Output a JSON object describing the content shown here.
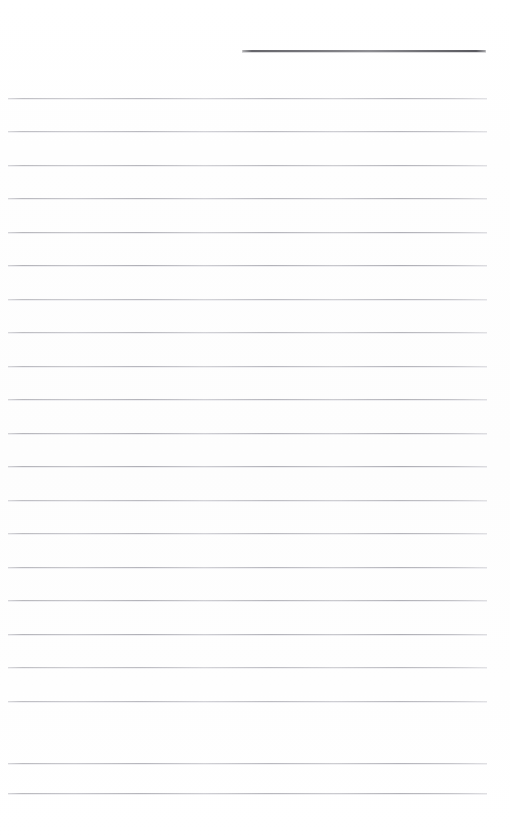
{
  "document": {
    "type": "lined-note-paper",
    "title": "",
    "page_width": 510,
    "page_height": 838,
    "background_color": "#ffffff",
    "written_content": "",
    "has_text": false
  },
  "header_rule": {
    "name": "header-rule",
    "description": "dark horizontal rule in upper right",
    "x": 242,
    "y": 50,
    "width": 244,
    "thickness": 2,
    "color": "#5a5a60"
  },
  "ruled_lines": {
    "count": 21,
    "color": "#b0b0b6",
    "thickness": 1,
    "left_x": 8,
    "right_x": 487,
    "line_width": 479,
    "first_y": 98,
    "spacing": 33.5,
    "positions": [
      98,
      131,
      165,
      198,
      232,
      265,
      299,
      332,
      366,
      399,
      433,
      466,
      500,
      533,
      567,
      600,
      634,
      667,
      701,
      763,
      793
    ]
  },
  "margins": {
    "top": 98,
    "bottom": 45,
    "left": 8,
    "right": 23
  }
}
